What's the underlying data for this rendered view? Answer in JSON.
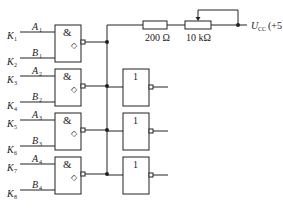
{
  "diagram": {
    "type": "logic-circuit",
    "and_gates": [
      {
        "symbol": "&",
        "input_a": "A",
        "input_a_sub": "1",
        "input_b": "B",
        "input_b_sub": "1",
        "switch_a": "K",
        "switch_a_sub": "1",
        "switch_b": "K",
        "switch_b_sub": "2",
        "output_symbol": "◇"
      },
      {
        "symbol": "&",
        "input_a": "A",
        "input_a_sub": "2",
        "input_b": "B",
        "input_b_sub": "2",
        "switch_a": "K",
        "switch_a_sub": "3",
        "switch_b": "K",
        "switch_b_sub": "4",
        "output_symbol": "◇"
      },
      {
        "symbol": "&",
        "input_a": "A",
        "input_a_sub": "3",
        "input_b": "B",
        "input_b_sub": "3",
        "switch_a": "K",
        "switch_a_sub": "5",
        "switch_b": "K",
        "switch_b_sub": "6",
        "output_symbol": "◇"
      },
      {
        "symbol": "&",
        "input_a": "A",
        "input_a_sub": "4",
        "input_b": "B",
        "input_b_sub": "4",
        "switch_a": "K",
        "switch_a_sub": "7",
        "switch_b": "K",
        "switch_b_sub": "8",
        "output_symbol": "◇"
      }
    ],
    "not_gates": [
      {
        "symbol": "1"
      },
      {
        "symbol": "1"
      },
      {
        "symbol": "1"
      }
    ],
    "resistors": [
      {
        "label": "200 Ω"
      },
      {
        "label": "10 kΩ",
        "variable": true
      }
    ],
    "supply": {
      "symbol": "U",
      "sub": "CC",
      "value": "(+5 V)"
    },
    "colors": {
      "line": "#222222",
      "background": "#ffffff"
    }
  }
}
